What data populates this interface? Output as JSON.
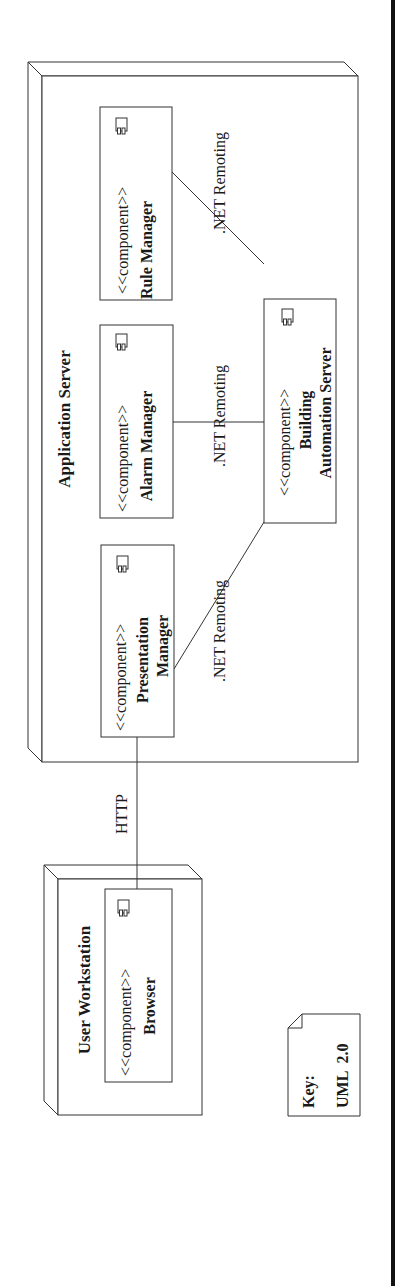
{
  "diagram": {
    "type": "UML deployment diagram",
    "orientation": "rotated-90-ccw",
    "stroke_color": "#333333",
    "nodes": [
      {
        "id": "application-server",
        "label": "Application Server",
        "components": [
          {
            "id": "rule-manager",
            "stereotype": "<<component>>",
            "name_lines": [
              "Rule Manager"
            ]
          },
          {
            "id": "alarm-manager",
            "stereotype": "<<component>>",
            "name_lines": [
              "Alarm Manager"
            ]
          },
          {
            "id": "presentation-manager",
            "stereotype": "<<component>>",
            "name_lines": [
              "Presentation",
              "Manager"
            ]
          },
          {
            "id": "building-automation-server",
            "stereotype": "<<component>>",
            "name_lines": [
              "Building",
              "Automation Server"
            ]
          }
        ]
      },
      {
        "id": "user-workstation",
        "label": "User Workstation",
        "components": [
          {
            "id": "browser",
            "stereotype": "<<component>>",
            "name_lines": [
              "Browser"
            ]
          }
        ]
      }
    ],
    "connections": [
      {
        "from": "rule-manager",
        "to": "building-automation-server",
        "label": ".NET Remoting"
      },
      {
        "from": "alarm-manager",
        "to": "building-automation-server",
        "label": ".NET Remoting"
      },
      {
        "from": "presentation-manager",
        "to": "building-automation-server",
        "label": ".NET Remoting"
      },
      {
        "from": "browser",
        "to": "presentation-manager",
        "label": "HTTP"
      }
    ],
    "key": {
      "title": "Key:",
      "value": "UML  2.0"
    }
  }
}
